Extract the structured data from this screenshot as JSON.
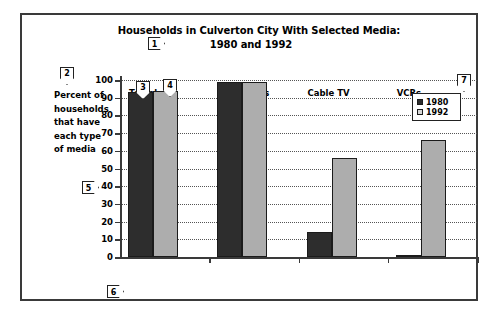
{
  "chart_data": {
    "type": "bar",
    "title": "Households in Culverton City With Selected Media:",
    "subtitle": "1980 and 1992",
    "xlabel": "",
    "ylabel": "Percent of households that have each type of media",
    "ylim": [
      0,
      100
    ],
    "ytick_labels": [
      "0",
      "10",
      "20",
      "30",
      "40",
      "50",
      "60",
      "70",
      "80",
      "90",
      "100"
    ],
    "ytick_values": [
      0,
      10,
      20,
      30,
      40,
      50,
      60,
      70,
      80,
      90,
      100
    ],
    "grid": true,
    "legend_position": "top-right",
    "categories": [
      "Telephone Service",
      "Radio Sets",
      "Cable TV",
      "VCRs"
    ],
    "series": [
      {
        "name": "1980",
        "color": "#2d2d2d",
        "values": [
          93,
          99,
          14,
          1
        ]
      },
      {
        "name": "1992",
        "color": "#adadad",
        "values": [
          94,
          99,
          56,
          66
        ]
      }
    ]
  },
  "axis_caption": {
    "line_1": "Percent of",
    "line_2": "households",
    "line_3": "that have",
    "line_4": "each type",
    "line_5": "of media"
  },
  "category_labels": {
    "telephone_line_1": "Telephone",
    "telephone_line_2": "Service",
    "radio": "Radio Sets",
    "cable": "Cable TV",
    "vcr": "VCRs"
  },
  "legend": {
    "items": [
      {
        "label": "1980",
        "color": "#2d2d2d"
      },
      {
        "label": "1992",
        "color": "#d8d8d8"
      }
    ]
  },
  "callouts": [
    {
      "id": "1",
      "label": "1",
      "shape": "right-pentagon",
      "target": "chart-title"
    },
    {
      "id": "2",
      "label": "2",
      "shape": "down-shield",
      "target": "y-axis-caption"
    },
    {
      "id": "3",
      "label": "3",
      "shape": "down-shield",
      "target": "bar-1980-telephone"
    },
    {
      "id": "4",
      "label": "4",
      "shape": "down-shield",
      "target": "bar-1992-telephone"
    },
    {
      "id": "5",
      "label": "5",
      "shape": "right-pentagon",
      "target": "y-axis-scale"
    },
    {
      "id": "6",
      "label": "6",
      "shape": "right-pentagon",
      "target": "x-axis-categories"
    },
    {
      "id": "7",
      "label": "7",
      "shape": "down-shield",
      "target": "legend"
    }
  ]
}
